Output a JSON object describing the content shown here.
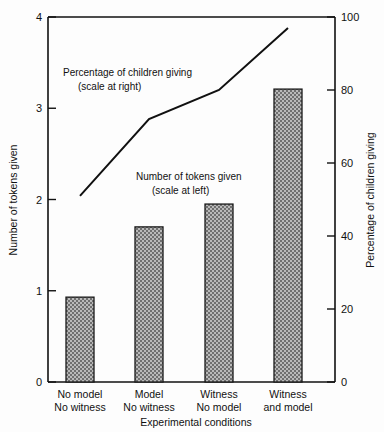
{
  "chart_data": {
    "type": "bar",
    "title": "",
    "categories": [
      "No model\nNo witness",
      "Model\nNo witness",
      "Witness\nNo model",
      "Witness\nand model"
    ],
    "category_lines": [
      [
        "No model",
        "No witness"
      ],
      [
        "Model",
        "No witness"
      ],
      [
        "Witness",
        "No model"
      ],
      [
        "Witness",
        "and model"
      ]
    ],
    "xlabel": "Experimental conditions",
    "ylabel": "Number of tokens given",
    "ylabel_right": "Percentage of children giving",
    "ylim": [
      0,
      4
    ],
    "ylim_right": [
      0,
      100
    ],
    "yticks": [
      "0",
      "1",
      "2",
      "3",
      "4"
    ],
    "ytick_values": [
      0,
      1,
      2,
      3,
      4
    ],
    "yticks_right": [
      "0",
      "20",
      "40",
      "60",
      "80",
      "100"
    ],
    "ytick_values_right": [
      0,
      20,
      40,
      60,
      80,
      100
    ],
    "grid": false,
    "legend_position": "inline-annotation",
    "series": [
      {
        "name": "Number of tokens given",
        "type": "bar",
        "axis": "left",
        "values": [
          0.93,
          1.7,
          1.95,
          3.21
        ]
      },
      {
        "name": "Percentage of children giving",
        "type": "line",
        "axis": "right",
        "values": [
          51,
          72,
          80,
          97
        ]
      }
    ],
    "annotations": [
      {
        "name": "line-series-annotation",
        "lines": [
          "Percentage of children giving",
          "(scale at right)"
        ]
      },
      {
        "name": "bar-series-annotation",
        "lines": [
          "Number of tokens given",
          "(scale at left)"
        ]
      }
    ],
    "colors": {
      "bar_fill": "#8c8c8c",
      "bar_edge": "#1a1a1a",
      "line": "#111111",
      "axis": "#111111",
      "background": "#fdfdfd"
    }
  }
}
